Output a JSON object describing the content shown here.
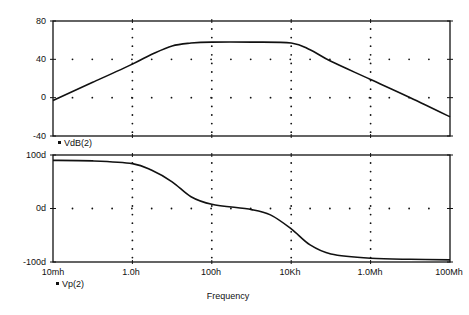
{
  "chart_data": [
    {
      "type": "line",
      "title": "",
      "xlabel": "Frequency",
      "ylabel": "",
      "xscale": "log",
      "xlim_hz": [
        0.01,
        100000000
      ],
      "ylim": [
        -40,
        80
      ],
      "yticks": [
        80,
        40,
        0,
        -40
      ],
      "ytick_labels": [
        "80",
        "40",
        "0",
        "-40"
      ],
      "grid": "dotted",
      "legend": [
        "VdB(2)"
      ],
      "series": [
        {
          "name": "VdB(2)",
          "x_hz": [
            0.01,
            0.1,
            1,
            3,
            10,
            30,
            100,
            1000,
            10000,
            30000,
            100000,
            1000000,
            10000000,
            100000000
          ],
          "values": [
            -3,
            16,
            35,
            45,
            54,
            57,
            58,
            58,
            57,
            50,
            38,
            19,
            0,
            -20
          ]
        }
      ]
    },
    {
      "type": "line",
      "title": "",
      "xlabel": "Frequency",
      "ylabel": "",
      "xscale": "log",
      "xlim_hz": [
        0.01,
        100000000
      ],
      "ylim": [
        -100,
        100
      ],
      "yticks": [
        100,
        0,
        -100
      ],
      "ytick_labels": [
        "100d",
        "0d",
        "-100d"
      ],
      "grid": "dotted",
      "legend": [
        "Vp(2)"
      ],
      "series": [
        {
          "name": "Vp(2)",
          "x_hz": [
            0.01,
            0.1,
            1,
            3,
            10,
            30,
            100,
            1000,
            3000,
            10000,
            30000,
            100000,
            1000000,
            10000000,
            100000000
          ],
          "values": [
            90,
            89,
            84,
            72,
            50,
            22,
            8,
            -2,
            -12,
            -38,
            -68,
            -85,
            -93,
            -95,
            -96
          ]
        }
      ]
    }
  ],
  "x_axis": {
    "tick_labels": [
      "10mh",
      "1.0h",
      "100h",
      "10Kh",
      "1.0Mh",
      "100Mh"
    ],
    "title": "Frequency"
  },
  "legends": {
    "upper": "VdB(2)",
    "lower": "Vp(2)"
  },
  "upper_y_labels": [
    "80",
    "40",
    "0",
    "-40"
  ],
  "lower_y_labels": [
    "100d",
    "0d",
    "-100d"
  ]
}
